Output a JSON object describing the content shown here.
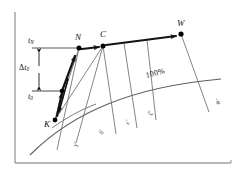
{
  "figure": {
    "name": "thermal-characteristic-diagram",
    "background_color": "#ffffff",
    "frame_color": "#9a9a9a",
    "thick_line_color": "#1a1a1a",
    "thin_line_color": "#6e6e6e",
    "curve_color": "#5d5d5d",
    "point_color": "#000000"
  },
  "axes": {
    "vertical_axis_name": "vertical-axis",
    "horizontal_axis_name": "horizontal-axis"
  },
  "level_lines": {
    "upper": {
      "label": "t",
      "subscript": "N",
      "name": "level-line-tn"
    },
    "lower": {
      "label": "t",
      "subscript": "0",
      "name": "level-line-t0"
    },
    "dimension": {
      "delta": "Δ",
      "label": "t",
      "subscript": "0",
      "name": "delta-t0-dimension"
    }
  },
  "points": [
    {
      "id": "K",
      "label": "K",
      "x": 55,
      "y": 120
    },
    {
      "id": "N",
      "label": "N",
      "x": 79,
      "y": 48
    },
    {
      "id": "C",
      "label": "C",
      "x": 103,
      "y": 46
    },
    {
      "id": "W",
      "label": "W",
      "x": 181,
      "y": 34
    }
  ],
  "curve": {
    "label": "100%",
    "name": "characteristic-curve-100"
  },
  "diagonal_labels": [
    {
      "id": "d1",
      "text": "γ′",
      "name": "diagonal-label-1"
    },
    {
      "id": "d2",
      "text": "δ′",
      "name": "diagonal-label-2"
    },
    {
      "id": "d3",
      "text": "ε′",
      "name": "diagonal-label-3"
    },
    {
      "id": "d4",
      "text": "ζ′",
      "name": "diagonal-label-4"
    },
    {
      "id": "d5",
      "text": "φ′",
      "name": "diagonal-label-5"
    }
  ]
}
